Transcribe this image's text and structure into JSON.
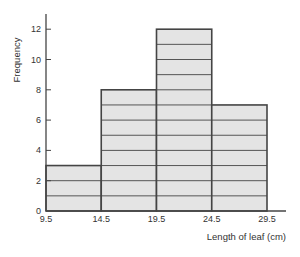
{
  "chart_data": {
    "type": "bar",
    "subtype": "histogram",
    "title": "",
    "xlabel": "Length of leaf (cm)",
    "ylabel": "Frequency",
    "bin_edges": [
      9.5,
      14.5,
      19.5,
      24.5,
      29.5
    ],
    "categories": [
      "9.5–14.5",
      "14.5–19.5",
      "19.5–24.5",
      "24.5–29.5"
    ],
    "values": [
      3,
      8,
      12,
      7
    ],
    "x_tick_labels": [
      "9.5",
      "14.5",
      "19.5",
      "24.5",
      "29.5"
    ],
    "y_tick_labels": [
      "0",
      "2",
      "4",
      "6",
      "8",
      "10",
      "12"
    ],
    "ylim": [
      0,
      13
    ],
    "grid": false,
    "bar_unit_lines": true,
    "bar_fill": "#e4e4e4",
    "bar_stroke": "#444444"
  }
}
